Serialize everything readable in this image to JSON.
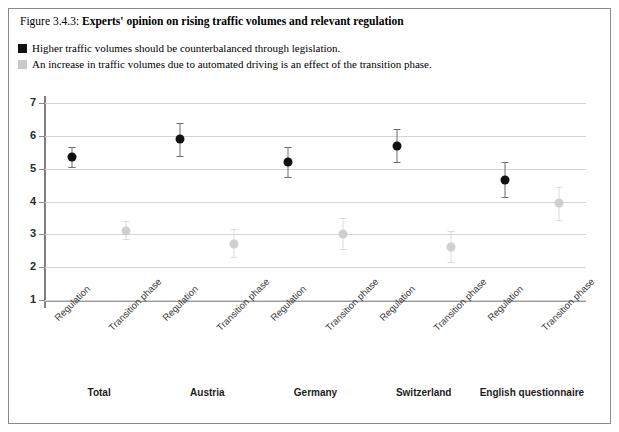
{
  "figure": {
    "number": "Figure 3.4.3:",
    "title": "Experts' opinion on rising traffic volumes and relevant regulation"
  },
  "legend": {
    "items": [
      {
        "label": "Higher traffic volumes should be counterbalanced through legislation.",
        "color": "#111111",
        "swatch_name": "legend-swatch-dark"
      },
      {
        "label": "An increase in traffic volumes due to automated driving is an effect of the transition phase.",
        "color": "#c9c9c9",
        "swatch_name": "legend-swatch-light"
      }
    ]
  },
  "chart_data": {
    "type": "scatter",
    "title": "Experts' opinion on rising traffic volumes and relevant regulation",
    "xlabel": "",
    "ylabel": "",
    "ylim": [
      1,
      7
    ],
    "yticks": [
      1,
      2,
      3,
      4,
      5,
      6,
      7
    ],
    "grid": true,
    "legend_position": "top",
    "groups": [
      "Total",
      "Austria",
      "Germany",
      "Switzerland",
      "English questionnaire"
    ],
    "conditions": [
      "Regulation",
      "Transition phase"
    ],
    "categories": [
      "Regulation",
      "Transition phase",
      "Regulation",
      "Transition phase",
      "Regulation",
      "Transition phase",
      "Regulation",
      "Transition phase",
      "Regulation",
      "Transition phase"
    ],
    "series": [
      {
        "name": "Higher traffic volumes should be counterbalanced through legislation.",
        "condition": "Regulation",
        "color": "#111111",
        "points": [
          {
            "group": "Total",
            "value": 5.35,
            "low": 5.05,
            "high": 5.65
          },
          {
            "group": "Austria",
            "value": 5.9,
            "low": 5.4,
            "high": 6.4
          },
          {
            "group": "Germany",
            "value": 5.2,
            "low": 4.75,
            "high": 5.65
          },
          {
            "group": "Switzerland",
            "value": 5.7,
            "low": 5.2,
            "high": 6.2
          },
          {
            "group": "English questionnaire",
            "value": 4.65,
            "low": 4.15,
            "high": 5.2
          }
        ]
      },
      {
        "name": "An increase in traffic volumes due to automated driving is an effect of the transition phase.",
        "condition": "Transition phase",
        "color": "#cfcfcf",
        "points": [
          {
            "group": "Total",
            "value": 3.1,
            "low": 2.85,
            "high": 3.4
          },
          {
            "group": "Austria",
            "value": 2.7,
            "low": 2.3,
            "high": 3.15
          },
          {
            "group": "Germany",
            "value": 3.0,
            "low": 2.55,
            "high": 3.5
          },
          {
            "group": "Switzerland",
            "value": 2.6,
            "low": 2.15,
            "high": 3.1
          },
          {
            "group": "English questionnaire",
            "value": 3.95,
            "low": 3.45,
            "high": 4.45
          }
        ]
      }
    ]
  }
}
